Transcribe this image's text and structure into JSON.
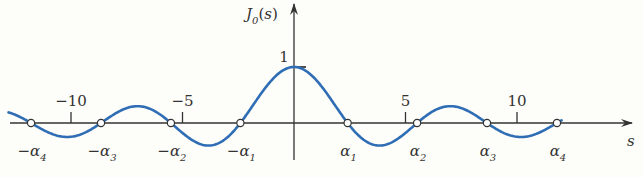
{
  "chart_data": {
    "type": "line",
    "title": "",
    "function": "J0(s)",
    "ylabel": "J_0(s)",
    "ylabel_sub": "0",
    "ylabel_base": "J",
    "ylabel_arg": "(s)",
    "xlabel": "s",
    "xlim": [
      -12.9,
      12.0
    ],
    "ylim": [
      -0.5,
      1.3
    ],
    "x_ticks": [
      {
        "value": -10,
        "label": "−10"
      },
      {
        "value": -5,
        "label": "−5"
      },
      {
        "value": 5,
        "label": "5"
      },
      {
        "value": 10,
        "label": "10"
      }
    ],
    "y_ticks": [
      {
        "value": 1,
        "label": "1"
      }
    ],
    "series": [
      {
        "name": "J0(s)",
        "color": "#2f6db5",
        "x_range": [
          -12.8,
          12.0
        ]
      }
    ],
    "zeros": [
      {
        "value": -11.792,
        "label_base": "−α",
        "label_sub": "4"
      },
      {
        "value": -8.654,
        "label_base": "−α",
        "label_sub": "3"
      },
      {
        "value": -5.52,
        "label_base": "−α",
        "label_sub": "2"
      },
      {
        "value": -2.405,
        "label_base": "−α",
        "label_sub": "1"
      },
      {
        "value": 2.405,
        "label_base": "α",
        "label_sub": "1"
      },
      {
        "value": 5.52,
        "label_base": "α",
        "label_sub": "2"
      },
      {
        "value": 8.654,
        "label_base": "α",
        "label_sub": "3"
      },
      {
        "value": 11.792,
        "label_base": "α",
        "label_sub": "4"
      }
    ],
    "grid": false,
    "legend": "none"
  }
}
